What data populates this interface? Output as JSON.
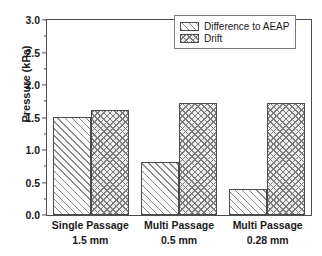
{
  "chart_data": {
    "type": "bar",
    "title": "",
    "xlabel": "",
    "ylabel": "Pressure (kPa)",
    "ylim": [
      0.0,
      3.0
    ],
    "ytick_labels": [
      "0.0",
      "0.5",
      "1.0",
      "1.5",
      "2.0",
      "2.5",
      "3.0"
    ],
    "ytick_values": [
      0.0,
      0.5,
      1.0,
      1.5,
      2.0,
      2.5,
      3.0
    ],
    "minor_ticks": true,
    "grid": false,
    "legend_position": "top-right",
    "categories": [
      {
        "line1": "Single Passage",
        "line2": "1.5 mm"
      },
      {
        "line1": "Multi Passage",
        "line2": "0.5 mm"
      },
      {
        "line1": "Multi Passage",
        "line2": "0.28 mm"
      }
    ],
    "series": [
      {
        "name": "Difference to AEAP",
        "pattern": "diagonal-hatch",
        "color": "#8a8a8a",
        "values": [
          1.51,
          0.82,
          0.4
        ]
      },
      {
        "name": "Drift",
        "pattern": "cross-hatch",
        "color": "#7d7d7d",
        "values": [
          1.61,
          1.72,
          1.72
        ]
      }
    ]
  },
  "legend": {
    "entries": [
      {
        "label": "Difference to AEAP"
      },
      {
        "label": "Drift"
      }
    ]
  }
}
